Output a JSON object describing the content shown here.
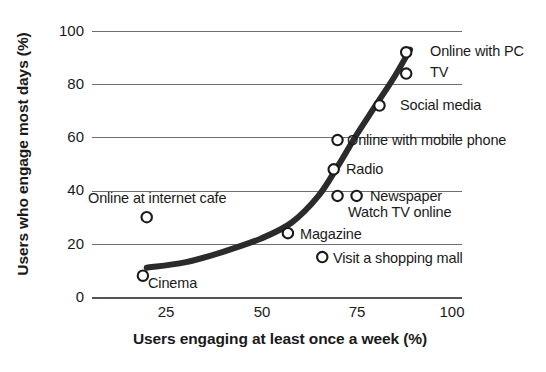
{
  "chart_data": {
    "type": "scatter",
    "title": "",
    "xlabel": "Users engaging at least once a week (%)",
    "ylabel": "Users who engage most days (%)",
    "xlim": [
      0,
      106
    ],
    "ylim": [
      0,
      104
    ],
    "xticks": [
      25,
      50,
      75,
      100
    ],
    "yticks": [
      0,
      20,
      40,
      60,
      80,
      100
    ],
    "grid": true,
    "legend": false,
    "marker_style": "open-circle",
    "colors": {
      "axis": "#6e6e6e",
      "baseline": "#555555",
      "marker": "#1a1a1a",
      "trend": "#2b2b2b",
      "text": "#1a1a1a",
      "background": "#ffffff"
    },
    "points": [
      {
        "label": "Online with PC",
        "x": 88,
        "y": 92,
        "label_pos": "right"
      },
      {
        "label": "TV",
        "x": 88,
        "y": 84,
        "label_pos": "right"
      },
      {
        "label": "Social media",
        "x": 81,
        "y": 72,
        "label_pos": "right"
      },
      {
        "label": "Online with mobile phone",
        "x": 70,
        "y": 59,
        "label_pos": "right"
      },
      {
        "label": "Radio",
        "x": 69,
        "y": 48,
        "label_pos": "right"
      },
      {
        "label": "Newspaper",
        "x": 75,
        "y": 38,
        "label_pos": "right"
      },
      {
        "label": "Watch TV online",
        "x": 70,
        "y": 38,
        "label_pos": "below-right"
      },
      {
        "label": "Online at internet cafe",
        "x": 20,
        "y": 30,
        "label_pos": "above"
      },
      {
        "label": "Magazine",
        "x": 57,
        "y": 24,
        "label_pos": "right"
      },
      {
        "label": "Visit a shopping mall",
        "x": 66,
        "y": 15,
        "label_pos": "right"
      },
      {
        "label": "Cinema",
        "x": 19,
        "y": 8,
        "label_pos": "right"
      }
    ],
    "trendline": {
      "style": "smooth-exponential",
      "width_px": 6,
      "points": [
        {
          "x": 20,
          "y": 11
        },
        {
          "x": 30,
          "y": 13
        },
        {
          "x": 40,
          "y": 17
        },
        {
          "x": 50,
          "y": 22
        },
        {
          "x": 58,
          "y": 28
        },
        {
          "x": 65,
          "y": 38
        },
        {
          "x": 70,
          "y": 49
        },
        {
          "x": 75,
          "y": 61
        },
        {
          "x": 80,
          "y": 72
        },
        {
          "x": 85,
          "y": 83
        },
        {
          "x": 89,
          "y": 93
        }
      ]
    }
  },
  "axis": {
    "y_tick_labels": [
      "100",
      "80",
      "60",
      "40",
      "20",
      "0"
    ],
    "x_tick_labels": [
      "25",
      "50",
      "75",
      "100"
    ],
    "y_title": "Users who engage most days (%)",
    "x_title": "Users engaging at least once a week (%)"
  },
  "labels": {
    "online_with_pc": "Online with PC",
    "tv": "TV",
    "social_media": "Social media",
    "online_with_mobile_phone": "Online with mobile phone",
    "radio": "Radio",
    "newspaper": "Newspaper",
    "watch_tv_online": "Watch TV online",
    "online_at_internet_cafe": "Online at internet cafe",
    "magazine": "Magazine",
    "visit_a_shopping_mall": "Visit a shopping mall",
    "cinema": "Cinema"
  }
}
